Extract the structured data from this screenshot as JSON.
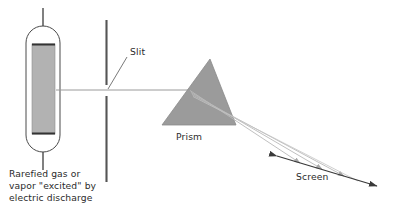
{
  "figure": {
    "background_color": "#ffffff",
    "width": 395,
    "height": 211
  },
  "labels": {
    "slit": "Slit",
    "prism": "Prism",
    "screen": "Screen",
    "source_line1": "Rarefied gas or",
    "source_line2": "vapor \"excited\" by",
    "source_line3": "electric discharge"
  },
  "colors": {
    "tube_fill": "#b2b2b2",
    "tube_stroke": "#4a4a4a",
    "prism_fill": "#9b9b9b",
    "prism_stroke": "#8a8a8a",
    "slit_bar": "#555555",
    "beam": "#9a9a9a",
    "ray": "#b9b9b9",
    "screen_line": "#3a3a3a",
    "text": "#2b2b2b",
    "leader": "#6a6a6a"
  },
  "geometry": {
    "tube": {
      "outline_x": 26,
      "outline_y": 26,
      "outline_width": 34,
      "outline_height": 126,
      "inner_x": 32,
      "inner_y": 44,
      "inner_width": 23,
      "inner_height": 90,
      "electrode_top_y": 8,
      "electrode_bottom_y": 170,
      "electrode_x": 43
    },
    "slit": {
      "bar_x": 106,
      "upper_top_y": 20,
      "upper_bottom_y": 85,
      "lower_top_y": 96,
      "lower_bottom_y": 182,
      "gap_center_y": 90
    },
    "beam": {
      "start_x": 60,
      "start_y": 90,
      "end_x": 185,
      "end_y": 90
    },
    "prism": {
      "apex_x": 210,
      "apex_y": 59,
      "left_x": 162,
      "left_y": 125,
      "right_x": 236,
      "right_y": 125
    },
    "screen": {
      "x1": 277,
      "y1": 156,
      "x2": 377,
      "y2": 186
    },
    "dispersed_rays": [
      {
        "x1": 191,
        "y1": 91,
        "x2": 303,
        "y2": 164
      },
      {
        "x1": 192,
        "y1": 93,
        "x2": 325,
        "y2": 170
      },
      {
        "x1": 193,
        "y1": 95,
        "x2": 347,
        "y2": 177
      }
    ]
  }
}
